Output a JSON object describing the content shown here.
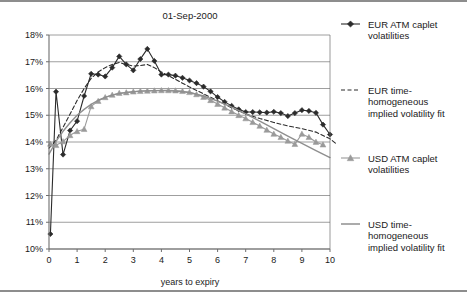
{
  "chart_data": {
    "type": "line",
    "title": "01-Sep-2000",
    "xlabel": "years to expiry",
    "ylabel": "",
    "xlim": [
      0,
      10
    ],
    "ylim": [
      0.1,
      0.18
    ],
    "grid": true,
    "legend_position": "right",
    "xticks": [
      "0",
      "1",
      "2",
      "3",
      "4",
      "5",
      "6",
      "7",
      "8",
      "9",
      "10"
    ],
    "xtick_values": [
      0,
      1,
      2,
      3,
      4,
      5,
      6,
      7,
      8,
      9,
      10
    ],
    "yticks": [
      "10%",
      "11%",
      "12%",
      "13%",
      "14%",
      "15%",
      "16%",
      "17%",
      "18%"
    ],
    "ytick_values": [
      0.1,
      0.11,
      0.12,
      0.13,
      0.14,
      0.15,
      0.16,
      0.17,
      0.18
    ],
    "series": [
      {
        "name": "EUR ATM caplet volatilities",
        "color": "#2b2b2b",
        "style": "solid",
        "marker": "diamond",
        "x": [
          0.05,
          0.25,
          0.5,
          0.75,
          1.0,
          1.25,
          1.5,
          1.75,
          2.0,
          2.25,
          2.5,
          2.75,
          3.0,
          3.25,
          3.5,
          3.75,
          4.0,
          4.25,
          4.5,
          4.75,
          5.0,
          5.25,
          5.5,
          5.75,
          6.0,
          6.25,
          6.5,
          6.75,
          7.0,
          7.25,
          7.5,
          7.75,
          8.0,
          8.25,
          8.5,
          8.75,
          9.0,
          9.25,
          9.5,
          9.75,
          10.0
        ],
        "y": [
          0.1056,
          0.1588,
          0.1353,
          0.1443,
          0.1478,
          0.1572,
          0.1655,
          0.1652,
          0.1645,
          0.1678,
          0.172,
          0.169,
          0.1668,
          0.171,
          0.1748,
          0.1703,
          0.1652,
          0.1652,
          0.1648,
          0.164,
          0.163,
          0.162,
          0.1607,
          0.1589,
          0.1568,
          0.155,
          0.1535,
          0.1522,
          0.1512,
          0.1512,
          0.1511,
          0.151,
          0.1513,
          0.1508,
          0.1497,
          0.1508,
          0.1519,
          0.1516,
          0.1509,
          0.1465,
          0.1428
        ]
      },
      {
        "name": "EUR time-homogeneous implied volatility fit",
        "color": "#2b2b2b",
        "style": "dashed",
        "marker": "none",
        "x": [
          0.0,
          0.25,
          0.5,
          0.75,
          1.0,
          1.25,
          1.5,
          1.75,
          2.0,
          2.25,
          2.5,
          2.75,
          3.0,
          3.25,
          3.5,
          3.75,
          4.0,
          4.25,
          4.5,
          4.75,
          5.0,
          5.5,
          6.0,
          6.5,
          7.0,
          7.5,
          8.0,
          8.5,
          9.0,
          9.5,
          10.0,
          10.2
        ],
        "y": [
          0.1377,
          0.1406,
          0.1455,
          0.1505,
          0.1555,
          0.16,
          0.1638,
          0.1662,
          0.1678,
          0.169,
          0.1697,
          0.169,
          0.1684,
          0.1686,
          0.169,
          0.1678,
          0.1662,
          0.1648,
          0.1634,
          0.162,
          0.1606,
          0.158,
          0.1554,
          0.1528,
          0.1505,
          0.1488,
          0.1473,
          0.146,
          0.145,
          0.1437,
          0.1412,
          0.1395
        ]
      },
      {
        "name": "USD ATM caplet volatilities",
        "color": "#9a9a9a",
        "style": "solid",
        "marker": "triangle",
        "x": [
          0.05,
          0.25,
          0.5,
          0.75,
          1.0,
          1.25,
          1.5,
          1.75,
          2.0,
          2.25,
          2.5,
          2.75,
          3.0,
          3.25,
          3.5,
          3.75,
          4.0,
          4.25,
          4.5,
          4.75,
          5.0,
          5.25,
          5.5,
          5.75,
          6.0,
          6.25,
          6.5,
          6.75,
          7.0,
          7.25,
          7.5,
          7.75,
          8.0,
          8.25,
          8.5,
          8.75,
          9.0,
          9.25,
          9.5,
          9.75
        ],
        "y": [
          0.1393,
          0.1388,
          0.1402,
          0.1425,
          0.144,
          0.1448,
          0.1533,
          0.1553,
          0.1567,
          0.1576,
          0.1583,
          0.1585,
          0.1588,
          0.159,
          0.1591,
          0.1592,
          0.1593,
          0.1593,
          0.1592,
          0.159,
          0.1586,
          0.1578,
          0.1568,
          0.1556,
          0.1542,
          0.1528,
          0.1514,
          0.15,
          0.1488,
          0.1474,
          0.146,
          0.1445,
          0.143,
          0.1418,
          0.1404,
          0.1392,
          0.143,
          0.1418,
          0.14,
          0.139
        ]
      },
      {
        "name": "USD time-homogeneous implied volatility fit",
        "color": "#8f8f8f",
        "style": "solid",
        "marker": "none",
        "x": [
          0.0,
          0.25,
          0.5,
          0.75,
          1.0,
          1.25,
          1.5,
          1.75,
          2.0,
          2.25,
          2.5,
          2.75,
          3.0,
          3.25,
          3.5,
          3.75,
          4.0,
          4.5,
          5.0,
          5.5,
          6.0,
          6.5,
          7.0,
          7.5,
          8.0,
          8.5,
          9.0,
          9.5,
          10.0
        ],
        "y": [
          0.1355,
          0.1402,
          0.144,
          0.1472,
          0.15,
          0.1522,
          0.1541,
          0.1556,
          0.1567,
          0.1575,
          0.1581,
          0.1585,
          0.1588,
          0.159,
          0.1591,
          0.1592,
          0.1592,
          0.159,
          0.1585,
          0.1572,
          0.1553,
          0.153,
          0.1505,
          0.1478,
          0.145,
          0.1422,
          0.1395,
          0.1368,
          0.1342
        ]
      }
    ]
  },
  "legend": {
    "items": [
      {
        "label_line1": "EUR ATM caplet",
        "label_line2": "volatilities",
        "label_line3": "",
        "marker": "diamond-line",
        "color": "#2b2b2b"
      },
      {
        "label_line1": "EUR time-",
        "label_line2": "homogeneous",
        "label_line3": "implied volatility fit",
        "marker": "dashed-line",
        "color": "#2b2b2b"
      },
      {
        "label_line1": "USD ATM caplet",
        "label_line2": "volatilities",
        "label_line3": "",
        "marker": "triangle-line",
        "color": "#9a9a9a"
      },
      {
        "label_line1": "USD time-",
        "label_line2": "homogeneous",
        "label_line3": "implied volatility fit",
        "marker": "solid-line",
        "color": "#8f8f8f"
      }
    ]
  },
  "colors": {
    "eur": "#2b2b2b",
    "usd": "#9a9a9a",
    "grid": "#878787",
    "axis": "#6e6e6e",
    "frame": "#8d8d8d"
  }
}
